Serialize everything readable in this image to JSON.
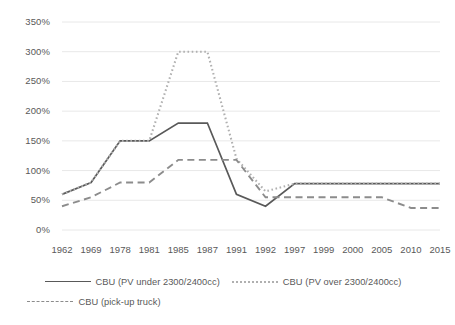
{
  "chart_data": {
    "type": "line",
    "title": "",
    "xlabel": "",
    "ylabel": "",
    "ylim": [
      0,
      350
    ],
    "ytick_labels": [
      "0%",
      "50%",
      "100%",
      "150%",
      "200%",
      "250%",
      "300%",
      "350%"
    ],
    "ytick_values": [
      0,
      50,
      100,
      150,
      200,
      250,
      300,
      350
    ],
    "grid": true,
    "legend_position": "bottom",
    "categories": [
      "1962",
      "1969",
      "1978",
      "1981",
      "1985",
      "1987",
      "1991",
      "1992",
      "1997",
      "1999",
      "2000",
      "2005",
      "2010",
      "2015"
    ],
    "series": [
      {
        "name": "CBU (PV under 2300/2400cc)",
        "style": "solid",
        "color": "#595959",
        "values": [
          60,
          80,
          150,
          150,
          180,
          180,
          60,
          40,
          78,
          78,
          78,
          78,
          78,
          78
        ]
      },
      {
        "name": "CBU (PV over 2300/2400cc)",
        "style": "dotted",
        "color": "#b0b0b0",
        "values": [
          60,
          80,
          150,
          150,
          300,
          300,
          120,
          65,
          78,
          78,
          78,
          78,
          78,
          78
        ]
      },
      {
        "name": "CBU (pick-up truck)",
        "style": "dashed",
        "color": "#8c8c8c",
        "values": [
          40,
          55,
          80,
          80,
          118,
          118,
          118,
          55,
          55,
          55,
          55,
          55,
          37,
          37
        ]
      }
    ]
  },
  "legend": {
    "items": [
      {
        "label": "CBU (PV under 2300/2400cc)"
      },
      {
        "label": "CBU (PV over 2300/2400cc)"
      },
      {
        "label": "CBU (pick-up truck)"
      }
    ]
  }
}
